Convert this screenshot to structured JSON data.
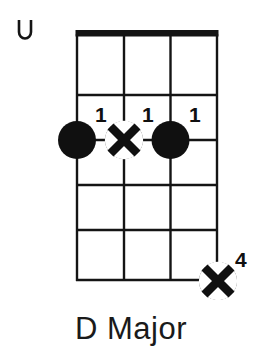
{
  "diagram": {
    "instrument_strings": 4,
    "fret_count": 5,
    "title": "D Major",
    "open_string_marker": {
      "icon": "open-string-u-icon",
      "label": "U",
      "string_index": 0,
      "x": 22,
      "y": 31
    },
    "grid": {
      "left": 77,
      "right": 217,
      "top": 33,
      "bottom": 281,
      "nut_thickness": 7,
      "line_color": "#141414",
      "line_thickness": 2.4,
      "string_x": [
        77,
        124,
        170.5,
        217
      ],
      "fret_y": [
        33,
        95,
        140,
        185,
        230,
        281
      ]
    },
    "markers": [
      {
        "id": "marker-string1-fret2",
        "type": "filled-dot",
        "icon": "filled-dot-icon",
        "string": 1,
        "fret": 2,
        "cx": 77,
        "cy": 140,
        "r": 19,
        "finger": "1",
        "label_x": 99,
        "label_y": 106,
        "color": "#101010"
      },
      {
        "id": "marker-string2-fret2",
        "type": "x-dot",
        "icon": "x-in-circle-icon",
        "string": 2,
        "fret": 2,
        "cx": 124,
        "cy": 140,
        "r": 19,
        "finger": "1",
        "label_x": 146,
        "label_y": 106,
        "color": "#101010"
      },
      {
        "id": "marker-string3-fret2",
        "type": "filled-dot",
        "icon": "filled-dot-icon",
        "string": 3,
        "fret": 2,
        "cx": 170.5,
        "cy": 140,
        "r": 19,
        "finger": "1",
        "label_x": 192,
        "label_y": 106,
        "color": "#101010"
      },
      {
        "id": "marker-string4-fret5",
        "type": "x-dot",
        "icon": "x-in-circle-icon",
        "string": 4,
        "fret": 5,
        "cx": 218,
        "cy": 281,
        "r": 19,
        "finger": "4",
        "label_x": 238,
        "label_y": 251,
        "color": "#101010"
      }
    ]
  },
  "labels": {
    "finger_1a": "1",
    "finger_1b": "1",
    "finger_1c": "1",
    "finger_4": "4"
  },
  "colors": {
    "ink": "#101010",
    "background": "#ffffff"
  }
}
